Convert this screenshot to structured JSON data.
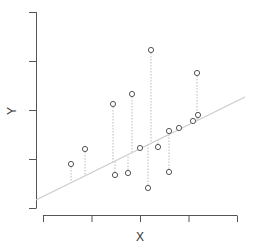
{
  "chart_data": {
    "type": "scatter",
    "title": "",
    "xlabel": "X",
    "ylabel": "Y",
    "grid": false,
    "legend": null,
    "x_ticks": [
      "",
      "",
      "",
      "",
      ""
    ],
    "y_ticks": [
      "",
      "",
      "",
      "",
      ""
    ],
    "annotations": "Dotted vertical residual segments connect each point to the fitted regression line",
    "points": [
      {
        "x": 71,
        "y": 164
      },
      {
        "x": 85,
        "y": 149
      },
      {
        "x": 113,
        "y": 104
      },
      {
        "x": 115,
        "y": 175
      },
      {
        "x": 128,
        "y": 173
      },
      {
        "x": 132,
        "y": 94
      },
      {
        "x": 140,
        "y": 148
      },
      {
        "x": 148,
        "y": 188
      },
      {
        "x": 151,
        "y": 50
      },
      {
        "x": 158,
        "y": 147
      },
      {
        "x": 169,
        "y": 172
      },
      {
        "x": 169,
        "y": 131
      },
      {
        "x": 179,
        "y": 128
      },
      {
        "x": 193,
        "y": 121
      },
      {
        "x": 197,
        "y": 73
      },
      {
        "x": 198,
        "y": 115
      }
    ],
    "regression_line": {
      "x1": 36,
      "y1": 200,
      "x2": 245,
      "y2": 97
    },
    "colors": {
      "axis": "#555555",
      "points": "#555555",
      "regression_line": "#cccccc",
      "residuals": "#bbbbbb"
    }
  },
  "axes": {
    "x_label": "X",
    "y_label": "Y"
  }
}
